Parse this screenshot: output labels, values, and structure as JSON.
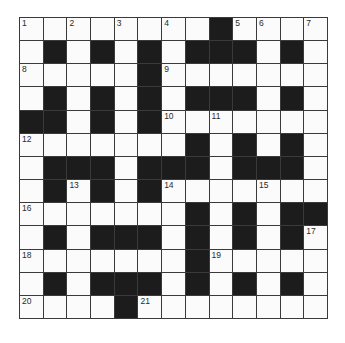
{
  "puzzle": {
    "type": "crossword",
    "rows": 13,
    "cols": 13,
    "colors": {
      "block": "#1c1c1c",
      "cell": "#fbfbfb",
      "line": "#3a3a3a",
      "number": "#2a2a2a"
    },
    "grid": [
      "WWWWWWWWBWWWW",
      "WBWBWBWBBBWBW",
      "WWWWWBWWWWWWW",
      "WBWBWBWBBBWBW",
      "BBWBWBWWWWWWW",
      "WWWWWWWBWBWBW",
      "WBBBWBBBWBBBW",
      "WBWBWBWWWWWWW",
      "WWWWWWWBWBWBB",
      "WBWBBBWBWBWBW",
      "WWWWWWWBWWWWW",
      "WBWBBBWBWBWBW",
      "WWWWBWWWWWWWW"
    ],
    "numbers": [
      {
        "n": "1",
        "r": 0,
        "c": 0
      },
      {
        "n": "2",
        "r": 0,
        "c": 2
      },
      {
        "n": "3",
        "r": 0,
        "c": 4
      },
      {
        "n": "4",
        "r": 0,
        "c": 6
      },
      {
        "n": "5",
        "r": 0,
        "c": 9
      },
      {
        "n": "6",
        "r": 0,
        "c": 10
      },
      {
        "n": "7",
        "r": 0,
        "c": 12
      },
      {
        "n": "8",
        "r": 2,
        "c": 0
      },
      {
        "n": "9",
        "r": 2,
        "c": 6
      },
      {
        "n": "10",
        "r": 4,
        "c": 6
      },
      {
        "n": "11",
        "r": 4,
        "c": 8
      },
      {
        "n": "12",
        "r": 5,
        "c": 0
      },
      {
        "n": "13",
        "r": 7,
        "c": 2
      },
      {
        "n": "14",
        "r": 7,
        "c": 6
      },
      {
        "n": "15",
        "r": 7,
        "c": 10
      },
      {
        "n": "16",
        "r": 8,
        "c": 0
      },
      {
        "n": "17",
        "r": 9,
        "c": 12
      },
      {
        "n": "18",
        "r": 10,
        "c": 0
      },
      {
        "n": "19",
        "r": 10,
        "c": 8
      },
      {
        "n": "20",
        "r": 12,
        "c": 0
      },
      {
        "n": "21",
        "r": 12,
        "c": 5
      }
    ]
  }
}
